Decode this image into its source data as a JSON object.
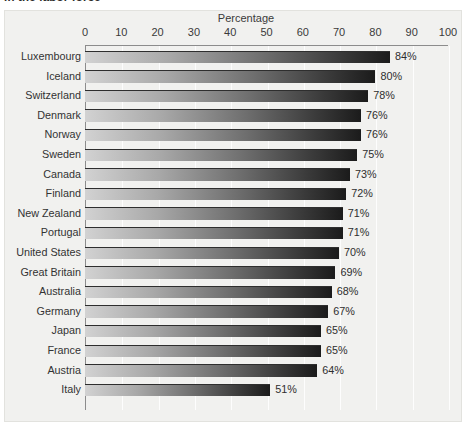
{
  "caption_fragment": "in the labor force",
  "chart_data": {
    "type": "bar",
    "orientation": "horizontal",
    "title": "",
    "xlabel": "Percentage",
    "ylabel": "",
    "xlim": [
      0,
      100
    ],
    "xticks": [
      0,
      10,
      20,
      30,
      40,
      50,
      60,
      70,
      80,
      90,
      100
    ],
    "grid": true,
    "legend": null,
    "value_suffix": "%",
    "categories": [
      "Luxembourg",
      "Iceland",
      "Switzerland",
      "Denmark",
      "Norway",
      "Sweden",
      "Canada",
      "Finland",
      "New Zealand",
      "Portugal",
      "United States",
      "Great Britain",
      "Australia",
      "Germany",
      "Japan",
      "France",
      "Austria",
      "Italy"
    ],
    "values": [
      84,
      80,
      78,
      76,
      76,
      75,
      73,
      72,
      71,
      71,
      70,
      69,
      68,
      67,
      65,
      65,
      64,
      51
    ],
    "value_labels": [
      "84%",
      "80%",
      "78%",
      "76%",
      "76%",
      "75%",
      "73%",
      "72%",
      "71%",
      "71%",
      "70%",
      "69%",
      "68%",
      "67%",
      "65%",
      "65%",
      "64%",
      "51%"
    ],
    "colors": {
      "bar_gradient_start": "#d2d2d2",
      "bar_gradient_end": "#1b1b1b",
      "panel_background": "#f1f1ef",
      "gridline": "#ffffff",
      "axis_line": "#8c8c8c",
      "text": "#333333"
    }
  }
}
